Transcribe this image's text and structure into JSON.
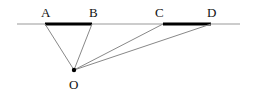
{
  "diagram": {
    "type": "geometry",
    "baseline": {
      "x1": 17,
      "y": 24,
      "x2": 240,
      "color": "#999999"
    },
    "segments": [
      {
        "name": "AB",
        "from": "A",
        "to": "B",
        "color": "#000000",
        "width": 3
      },
      {
        "name": "CD",
        "from": "C",
        "to": "D",
        "color": "#000000",
        "width": 3
      }
    ],
    "points": {
      "A": {
        "label": "A",
        "x": 45,
        "y": 24,
        "label_x": 41,
        "label_y": 17
      },
      "B": {
        "label": "B",
        "x": 92,
        "y": 24,
        "label_x": 89,
        "label_y": 17
      },
      "C": {
        "label": "C",
        "x": 163,
        "y": 24,
        "label_x": 155,
        "label_y": 17
      },
      "D": {
        "label": "D",
        "x": 211,
        "y": 24,
        "label_x": 207,
        "label_y": 17
      },
      "O": {
        "label": "O",
        "x": 74,
        "y": 70,
        "label_x": 69,
        "label_y": 89
      }
    },
    "rays": [
      {
        "from": "O",
        "to": "A"
      },
      {
        "from": "O",
        "to": "B"
      },
      {
        "from": "O",
        "to": "C"
      },
      {
        "from": "O",
        "to": "D"
      }
    ],
    "ray_color": "#888888"
  }
}
